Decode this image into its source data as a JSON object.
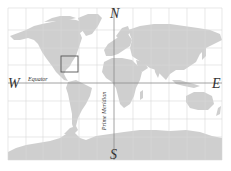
{
  "map": {
    "type": "world-map",
    "projection": "equirectangular",
    "colors": {
      "background": "#ffffff",
      "land": "#cfcfcf",
      "grid": "#d8d8d8",
      "reference_lines": "#8a8a8a",
      "highlight_box": "#555555",
      "text": "#333333"
    },
    "cardinal_directions": {
      "north": "N",
      "south": "S",
      "east": "E",
      "west": "W"
    },
    "reference_lines": {
      "equator": "Equator",
      "prime_meridian": "Prime Meridian"
    },
    "highlight_box": {
      "region": "eastern United States"
    }
  }
}
